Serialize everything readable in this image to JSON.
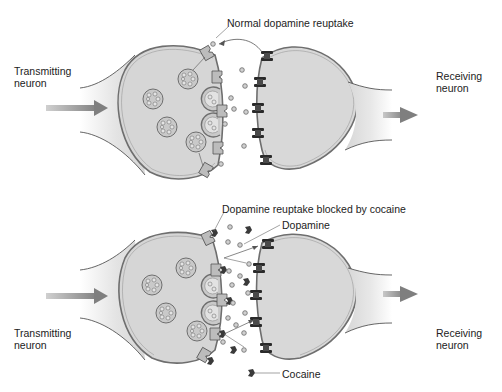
{
  "diagram": {
    "colors": {
      "cell_fill": "#d6d6d6",
      "membrane": "#7a7a7a",
      "arrow": "#8a8a8a",
      "receptor": "#2a2a2a",
      "transporter": "#b9b9b9",
      "dopamine": "#bdbdbd",
      "cocaine": "#3c3c3c",
      "text": "#222222"
    },
    "panels": [
      {
        "id": "normal",
        "left_label": {
          "line1": "Transmitting",
          "line2": "neuron"
        },
        "right_label": {
          "line1": "Receiving",
          "line2": "neuron"
        },
        "callouts": [
          "Normal dopamine reuptake"
        ]
      },
      {
        "id": "cocaine",
        "left_label": {
          "line1": "Transmitting",
          "line2": "neuron"
        },
        "right_label": {
          "line1": "Receiving",
          "line2": "neuron"
        },
        "callouts": [
          "Dopamine reuptake blocked by cocaine",
          "Dopamine",
          "Cocaine"
        ]
      }
    ]
  }
}
